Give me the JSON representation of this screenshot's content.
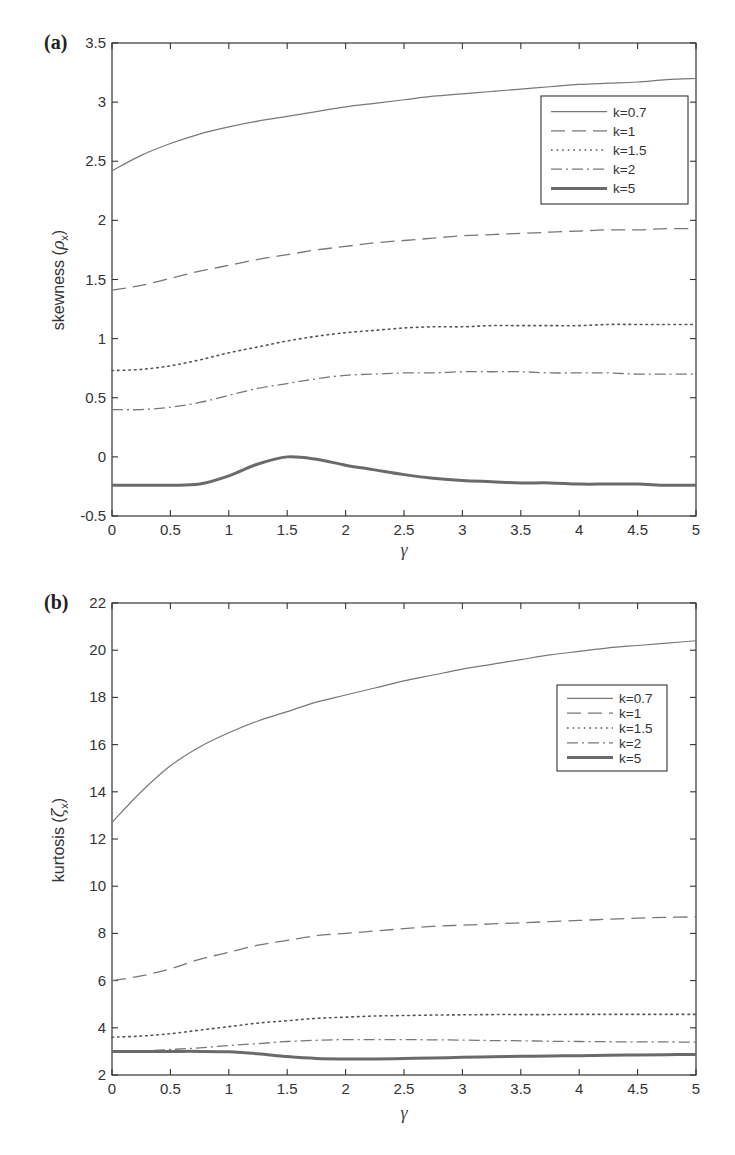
{
  "figure": {
    "panels": [
      {
        "id": "a",
        "label": "(a)"
      },
      {
        "id": "b",
        "label": "(b)"
      }
    ]
  },
  "styles": {
    "axis_color": "#333333",
    "series": [
      {
        "name": "k=0.7",
        "dash": "",
        "width": 1.2,
        "color": "#777777"
      },
      {
        "name": "k=1",
        "dash": "14,7",
        "width": 1.3,
        "color": "#777777"
      },
      {
        "name": "k=1.5",
        "dash": "1.6,4",
        "width": 1.6,
        "color": "#555555"
      },
      {
        "name": "k=2",
        "dash": "11,4,2,4",
        "width": 1.3,
        "color": "#777777"
      },
      {
        "name": "k=5",
        "dash": "",
        "width": 3,
        "color": "#6a6a6a"
      }
    ]
  },
  "chart_data": [
    {
      "type": "line",
      "panel": "(a)",
      "title": "",
      "xlabel": "γ",
      "ylabel": "skewness (ρx)",
      "ylabel_main": "skewness (",
      "ylabel_sym": "ρ",
      "ylabel_sub": "x",
      "ylabel_close": ")",
      "xlim": [
        0,
        5
      ],
      "ylim": [
        -0.5,
        3.5
      ],
      "xticks": [
        0,
        0.5,
        1,
        1.5,
        2,
        2.5,
        3,
        3.5,
        4,
        4.5,
        5
      ],
      "xtick_labels": [
        "0",
        "0.5",
        "1",
        "1.5",
        "2",
        "2.5",
        "3",
        "3.5",
        "4",
        "4.5",
        "5"
      ],
      "yticks": [
        -0.5,
        0,
        0.5,
        1,
        1.5,
        2,
        2.5,
        3,
        3.5
      ],
      "ytick_labels": [
        "-0.5",
        "0",
        "0.5",
        "1",
        "1.5",
        "2",
        "2.5",
        "3",
        "3.5"
      ],
      "grid": false,
      "legend_position": "upper right",
      "legend": [
        "k=0.7",
        "k=1",
        "k=1.5",
        "k=2",
        "k=5"
      ],
      "x": [
        0,
        0.25,
        0.5,
        0.75,
        1,
        1.25,
        1.5,
        1.75,
        2,
        2.25,
        2.5,
        2.75,
        3,
        3.25,
        3.5,
        3.75,
        4,
        4.25,
        4.5,
        4.75,
        5
      ],
      "series": [
        {
          "name": "k=0.7",
          "values": [
            2.42,
            2.55,
            2.65,
            2.73,
            2.79,
            2.84,
            2.88,
            2.92,
            2.96,
            2.99,
            3.02,
            3.05,
            3.07,
            3.09,
            3.11,
            3.13,
            3.15,
            3.16,
            3.17,
            3.19,
            3.2
          ]
        },
        {
          "name": "k=1",
          "values": [
            1.41,
            1.45,
            1.51,
            1.57,
            1.62,
            1.67,
            1.71,
            1.75,
            1.78,
            1.81,
            1.83,
            1.85,
            1.87,
            1.88,
            1.89,
            1.9,
            1.91,
            1.92,
            1.92,
            1.93,
            1.93
          ]
        },
        {
          "name": "k=1.5",
          "values": [
            0.73,
            0.74,
            0.77,
            0.82,
            0.88,
            0.93,
            0.98,
            1.02,
            1.05,
            1.07,
            1.09,
            1.1,
            1.1,
            1.11,
            1.11,
            1.11,
            1.11,
            1.12,
            1.12,
            1.12,
            1.12
          ]
        },
        {
          "name": "k=2",
          "values": [
            0.4,
            0.4,
            0.42,
            0.46,
            0.52,
            0.58,
            0.62,
            0.66,
            0.69,
            0.7,
            0.71,
            0.71,
            0.72,
            0.72,
            0.72,
            0.71,
            0.71,
            0.71,
            0.7,
            0.7,
            0.7
          ]
        },
        {
          "name": "k=5",
          "values": [
            -0.24,
            -0.24,
            -0.24,
            -0.23,
            -0.16,
            -0.06,
            0.0,
            -0.02,
            -0.07,
            -0.11,
            -0.15,
            -0.18,
            -0.2,
            -0.21,
            -0.22,
            -0.22,
            -0.23,
            -0.23,
            -0.23,
            -0.24,
            -0.24
          ]
        }
      ]
    },
    {
      "type": "line",
      "panel": "(b)",
      "title": "",
      "xlabel": "γ",
      "ylabel": "kurtosis (ζx)",
      "ylabel_main": "kurtosis (",
      "ylabel_sym": "ζ",
      "ylabel_sub": "x",
      "ylabel_close": ")",
      "xlim": [
        0,
        5
      ],
      "ylim": [
        2,
        22
      ],
      "xticks": [
        0,
        0.5,
        1,
        1.5,
        2,
        2.5,
        3,
        3.5,
        4,
        4.5,
        5
      ],
      "xtick_labels": [
        "0",
        "0.5",
        "1",
        "1.5",
        "2",
        "2.5",
        "3",
        "3.5",
        "4",
        "4.5",
        "5"
      ],
      "yticks": [
        2,
        4,
        6,
        8,
        10,
        12,
        14,
        16,
        18,
        20,
        22
      ],
      "ytick_labels": [
        "2",
        "4",
        "6",
        "8",
        "10",
        "12",
        "14",
        "16",
        "18",
        "20",
        "22"
      ],
      "grid": false,
      "legend_position": "upper right",
      "legend": [
        "k=0.7",
        "k=1",
        "k=1.5",
        "k=2",
        "k=5"
      ],
      "x": [
        0,
        0.25,
        0.5,
        0.75,
        1,
        1.25,
        1.5,
        1.75,
        2,
        2.25,
        2.5,
        2.75,
        3,
        3.25,
        3.5,
        3.75,
        4,
        4.25,
        4.5,
        4.75,
        5
      ],
      "series": [
        {
          "name": "k=0.7",
          "values": [
            12.7,
            14.0,
            15.1,
            15.9,
            16.5,
            17.0,
            17.4,
            17.8,
            18.1,
            18.4,
            18.7,
            18.95,
            19.2,
            19.4,
            19.6,
            19.8,
            19.95,
            20.1,
            20.2,
            20.3,
            20.4
          ]
        },
        {
          "name": "k=1",
          "values": [
            6.0,
            6.2,
            6.5,
            6.9,
            7.2,
            7.5,
            7.7,
            7.9,
            8.0,
            8.1,
            8.2,
            8.3,
            8.35,
            8.4,
            8.45,
            8.5,
            8.55,
            8.6,
            8.65,
            8.68,
            8.7
          ]
        },
        {
          "name": "k=1.5",
          "values": [
            3.6,
            3.65,
            3.75,
            3.9,
            4.05,
            4.2,
            4.3,
            4.4,
            4.45,
            4.5,
            4.52,
            4.54,
            4.55,
            4.56,
            4.56,
            4.56,
            4.57,
            4.57,
            4.57,
            4.57,
            4.57
          ]
        },
        {
          "name": "k=2",
          "values": [
            3.0,
            3.02,
            3.08,
            3.15,
            3.25,
            3.33,
            3.42,
            3.47,
            3.5,
            3.5,
            3.5,
            3.49,
            3.48,
            3.46,
            3.45,
            3.43,
            3.42,
            3.41,
            3.4,
            3.4,
            3.39
          ]
        },
        {
          "name": "k=5",
          "values": [
            3.0,
            3.0,
            3.0,
            3.0,
            2.98,
            2.9,
            2.78,
            2.7,
            2.68,
            2.68,
            2.7,
            2.72,
            2.75,
            2.77,
            2.79,
            2.81,
            2.82,
            2.84,
            2.85,
            2.86,
            2.87
          ]
        }
      ]
    }
  ]
}
